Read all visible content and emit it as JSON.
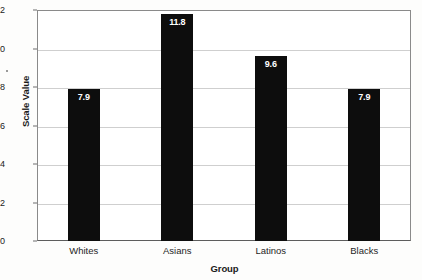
{
  "chart_data": {
    "type": "bar",
    "title": "",
    "xlabel": "Group",
    "ylabel": "Scale Value",
    "categories": [
      "Whites",
      "Asians",
      "Latinos",
      "Blacks"
    ],
    "values": [
      7.9,
      11.8,
      9.6,
      7.9
    ],
    "value_labels": [
      "7.9",
      "11.8",
      "9.6",
      "7.9"
    ],
    "ylim": [
      0,
      12
    ],
    "ytick_labels": [
      "0",
      "2",
      "4",
      "6",
      "8",
      "10",
      "12"
    ],
    "ytick_values": [
      0,
      2,
      4,
      6,
      8,
      10,
      12
    ],
    "grid": true,
    "legend": false,
    "legend_position": "none",
    "bar_color": "#0d0d0d",
    "value_label_color": "#ffffff",
    "gridline_color": "#cfcfcf",
    "frame_color": "#8a8a8a",
    "background_color": "#ffffff"
  }
}
